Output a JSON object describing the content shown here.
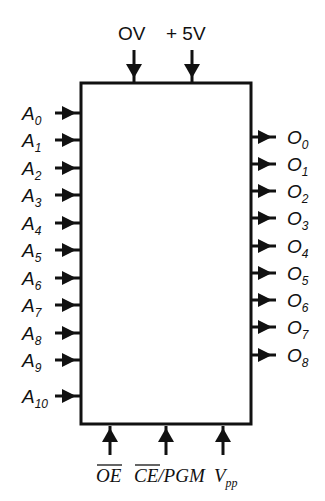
{
  "diagram": {
    "type": "chip-pinout",
    "box": {
      "x": 81,
      "y": 83,
      "width": 170,
      "height": 341,
      "stroke": "#111111"
    },
    "top_pins": [
      {
        "label": "OV",
        "x": 134,
        "label_x": 118
      },
      {
        "label": "+ 5V",
        "x": 192,
        "label_x": 166
      }
    ],
    "left_pins": [
      {
        "letter": "A",
        "sub": "0",
        "y": 113
      },
      {
        "letter": "A",
        "sub": "1",
        "y": 140
      },
      {
        "letter": "A",
        "sub": "2",
        "y": 168
      },
      {
        "letter": "A",
        "sub": "3",
        "y": 195
      },
      {
        "letter": "A",
        "sub": "4",
        "y": 223
      },
      {
        "letter": "A",
        "sub": "5",
        "y": 250
      },
      {
        "letter": "A",
        "sub": "6",
        "y": 278
      },
      {
        "letter": "A",
        "sub": "7",
        "y": 305
      },
      {
        "letter": "A",
        "sub": "8",
        "y": 333
      },
      {
        "letter": "A",
        "sub": "9",
        "y": 360
      },
      {
        "letter": "A",
        "sub": "10",
        "y": 396
      }
    ],
    "right_pins": [
      {
        "letter": "O",
        "sub": "0",
        "y": 137
      },
      {
        "letter": "O",
        "sub": "1",
        "y": 164
      },
      {
        "letter": "O",
        "sub": "2",
        "y": 191
      },
      {
        "letter": "O",
        "sub": "3",
        "y": 218
      },
      {
        "letter": "O",
        "sub": "4",
        "y": 246
      },
      {
        "letter": "O",
        "sub": "5",
        "y": 273
      },
      {
        "letter": "O",
        "sub": "6",
        "y": 300
      },
      {
        "letter": "O",
        "sub": "7",
        "y": 327
      },
      {
        "letter": "O",
        "sub": "8",
        "y": 355
      }
    ],
    "bottom_pins": [
      {
        "label": "OE",
        "overline": true,
        "x": 110
      },
      {
        "label": "CE/PGM",
        "overline_part": "CE",
        "x": 166
      },
      {
        "label": "V",
        "sub": "pp",
        "x": 223
      }
    ]
  }
}
